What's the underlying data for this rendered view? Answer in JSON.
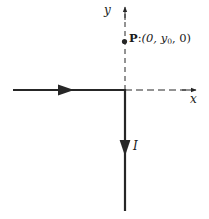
{
  "figure": {
    "kind": "physics-vector-diagram",
    "background_color": "#ffffff",
    "ink_color": "#262626",
    "axes": {
      "y_axis_label": "y",
      "x_axis_label": "x",
      "y_axis_style": "dashed-with-arrow",
      "x_axis_style": "dash-dot-with-arrow",
      "origin_px": [
        125,
        90
      ]
    },
    "point": {
      "marker": "filled-dot",
      "name": "P",
      "separator": ":",
      "coordinates_text": "(0, y",
      "subscript": "0",
      "coordinates_tail": ", 0)",
      "full_label": "P:(0, y0, 0)",
      "position_px": [
        124,
        41
      ]
    },
    "wires": {
      "horizontal": {
        "label": "",
        "direction": "rightward",
        "arrow_position_px": [
          68,
          90
        ],
        "start_px": [
          13,
          90
        ],
        "end_px": [
          125,
          90
        ]
      },
      "vertical": {
        "label": "I",
        "direction": "downward",
        "arrow_position_px": [
          125,
          148
        ],
        "start_px": [
          125,
          90
        ],
        "end_px": [
          125,
          211
        ]
      }
    },
    "current_symbol": "I"
  }
}
